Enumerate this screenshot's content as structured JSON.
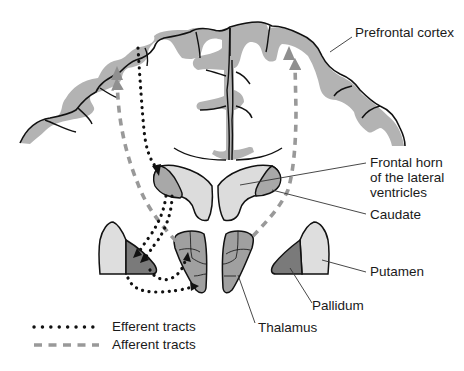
{
  "figure": {
    "type": "anatomical-diagram"
  },
  "labels": {
    "prefrontal_cortex": "Prefrontal cortex",
    "frontal_horn_line1": "Frontal horn",
    "frontal_horn_line2": "of the lateral",
    "frontal_horn_line3": "ventricles",
    "caudate": "Caudate",
    "putamen": "Putamen",
    "pallidum": "Pallidum",
    "thalamus": "Thalamus"
  },
  "legend": {
    "items": [
      {
        "label": "Efferent tracts",
        "style": "dotted",
        "color": "#111111"
      },
      {
        "label": "Afferent tracts",
        "style": "dashed",
        "color": "#999999"
      }
    ]
  },
  "colors": {
    "cortex_gray": "#b3b3b3",
    "ventricle_light": "#dcdcdc",
    "caudate_mid": "#a8a8a8",
    "putamen_light": "#dedede",
    "pallidum_dark": "#7a7a7a",
    "thalamus_mid": "#a0a0a0",
    "outline": "#111111",
    "efferent": "#111111",
    "afferent": "#9a9a9a"
  }
}
